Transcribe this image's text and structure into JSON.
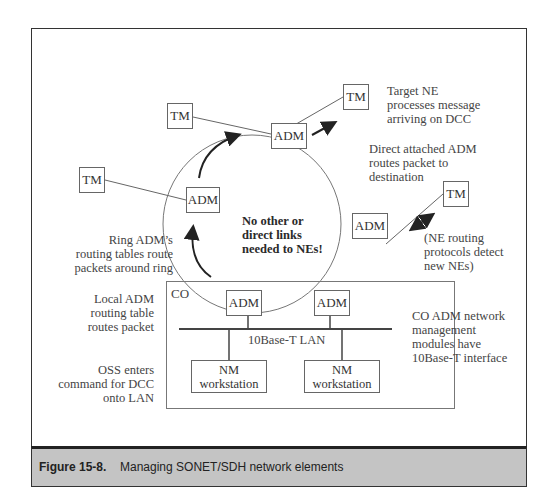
{
  "figure": {
    "number": "Figure 15-8.",
    "title": "Managing SONET/SDH network elements"
  },
  "nodes": {
    "tm_top_left": "TM",
    "tm_left": "TM",
    "tm_top_right": "TM",
    "tm_right": "TM",
    "adm_top": "ADM",
    "adm_left": "ADM",
    "adm_right": "ADM",
    "adm_co_left": "ADM",
    "adm_co_right": "ADM",
    "nm_left": "NM workstation",
    "nm_right": "NM workstation"
  },
  "co_label": "CO",
  "lan_label": "10Base-T LAN",
  "center_note": [
    "No other or",
    "direct links",
    "needed to NEs!"
  ],
  "annotations": {
    "target_ne": [
      "Target NE",
      "processes message",
      "arriving on DCC"
    ],
    "direct_attached": [
      "Direct attached ADM",
      "routes packet to",
      "destination"
    ],
    "ne_routing": [
      "(NE routing",
      "protocols detect",
      "new NEs)"
    ],
    "ring_adm": [
      "Ring ADM’s",
      "routing tables route",
      "packets around ring"
    ],
    "local_adm": [
      "Local ADM",
      "routing table",
      "routes packet"
    ],
    "oss": [
      "OSS enters",
      "command for DCC",
      "onto LAN"
    ],
    "co_adm": [
      "CO ADM network",
      "management",
      "modules have",
      "10Base-T interface"
    ]
  }
}
